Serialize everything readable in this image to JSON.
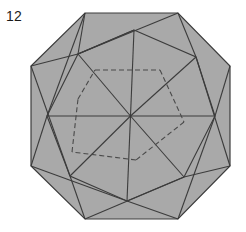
{
  "figure": {
    "label": "12",
    "title": "Octagon origami crease pattern diagram 12",
    "canvas": {
      "width": 246,
      "height": 232,
      "background": "#ffffff"
    },
    "colors": {
      "paper_fill": "#a9a9a9",
      "stroke": "#3c3c3c",
      "dashed_stroke": "#4a4a4a",
      "label_color": "#1a1a1a"
    },
    "stroke_widths": {
      "outline": 1.2,
      "crease": 1.1,
      "dashed": 1.1
    },
    "dash_pattern": "5,3",
    "center": {
      "x": 130.5,
      "y": 116.0
    },
    "outer_octagon": {
      "name": "outer-octagon",
      "points": [
        {
          "x": 85,
          "y": 13
        },
        {
          "x": 178,
          "y": 13
        },
        {
          "x": 230,
          "y": 66
        },
        {
          "x": 230,
          "y": 166
        },
        {
          "x": 178,
          "y": 219
        },
        {
          "x": 85,
          "y": 219
        },
        {
          "x": 31,
          "y": 166
        },
        {
          "x": 31,
          "y": 66
        }
      ]
    },
    "inner_heptagon": {
      "name": "inner-rotated-polygon",
      "points": [
        {
          "x": 134,
          "y": 30
        },
        {
          "x": 196,
          "y": 57
        },
        {
          "x": 215,
          "y": 116
        },
        {
          "x": 184,
          "y": 177
        },
        {
          "x": 127,
          "y": 201
        },
        {
          "x": 70,
          "y": 176
        },
        {
          "x": 47,
          "y": 116
        },
        {
          "x": 78,
          "y": 54
        }
      ]
    },
    "spokes": {
      "name": "center-spokes",
      "endpoints": [
        {
          "x": 134,
          "y": 30
        },
        {
          "x": 196,
          "y": 57
        },
        {
          "x": 215,
          "y": 116
        },
        {
          "x": 184,
          "y": 177
        },
        {
          "x": 127,
          "y": 201
        },
        {
          "x": 70,
          "y": 176
        },
        {
          "x": 47,
          "y": 116
        },
        {
          "x": 78,
          "y": 54
        }
      ]
    },
    "dashed_hexagon": {
      "name": "dashed-inner-hexagon",
      "points": [
        {
          "x": 133,
          "y": 58
        },
        {
          "x": 180,
          "y": 80
        },
        {
          "x": 187,
          "y": 131
        },
        {
          "x": 134,
          "y": 158
        },
        {
          "x": 86,
          "y": 149
        },
        {
          "x": 77,
          "y": 96
        }
      ]
    },
    "dashed_segments": [
      {
        "name": "dash-top",
        "x1": 95,
        "y1": 70,
        "x2": 160,
        "y2": 70
      },
      {
        "name": "dash-upper-right",
        "x1": 160,
        "y1": 70,
        "x2": 184,
        "y2": 122
      },
      {
        "name": "dash-lower-right",
        "x1": 184,
        "y1": 122,
        "x2": 136,
        "y2": 160
      },
      {
        "name": "dash-bottom",
        "x1": 136,
        "y1": 160,
        "x2": 72,
        "y2": 152
      },
      {
        "name": "dash-lower-left",
        "x1": 72,
        "y1": 152,
        "x2": 78,
        "y2": 99
      },
      {
        "name": "dash-upper-left",
        "x1": 78,
        "y1": 99,
        "x2": 95,
        "y2": 70
      }
    ],
    "crease_lines": [
      {
        "name": "crease-n-vertical",
        "x1": 130.5,
        "y1": 116,
        "x2": 134,
        "y2": 30
      },
      {
        "name": "crease-ne",
        "x1": 130.5,
        "y1": 116,
        "x2": 196,
        "y2": 57
      },
      {
        "name": "crease-e-horizontal",
        "x1": 130.5,
        "y1": 116,
        "x2": 215,
        "y2": 116
      },
      {
        "name": "crease-se",
        "x1": 130.5,
        "y1": 116,
        "x2": 184,
        "y2": 177
      },
      {
        "name": "crease-s",
        "x1": 130.5,
        "y1": 116,
        "x2": 127,
        "y2": 201
      },
      {
        "name": "crease-sw",
        "x1": 130.5,
        "y1": 116,
        "x2": 70,
        "y2": 176
      },
      {
        "name": "crease-w-horizontal",
        "x1": 130.5,
        "y1": 116,
        "x2": 47,
        "y2": 116
      },
      {
        "name": "crease-nw",
        "x1": 130.5,
        "y1": 116,
        "x2": 78,
        "y2": 54
      }
    ],
    "connector_lines": [
      {
        "name": "connector-top-left",
        "x1": 85,
        "y1": 13,
        "x2": 78,
        "y2": 54
      },
      {
        "name": "connector-top-right",
        "x1": 178,
        "y1": 13,
        "x2": 196,
        "y2": 57
      },
      {
        "name": "connector-right-top",
        "x1": 230,
        "y1": 66,
        "x2": 215,
        "y2": 116
      },
      {
        "name": "connector-right-bottom",
        "x1": 230,
        "y1": 166,
        "x2": 184,
        "y2": 177
      },
      {
        "name": "connector-bottom-right",
        "x1": 178,
        "y1": 219,
        "x2": 127,
        "y2": 201
      },
      {
        "name": "connector-bottom-left",
        "x1": 85,
        "y1": 219,
        "x2": 70,
        "y2": 176
      },
      {
        "name": "connector-left-bottom",
        "x1": 31,
        "y1": 166,
        "x2": 47,
        "y2": 116
      },
      {
        "name": "connector-left-top",
        "x1": 31,
        "y1": 66,
        "x2": 78,
        "y2": 54
      }
    ],
    "chord_lines": [
      {
        "name": "chord-top",
        "x1": 78,
        "y1": 54,
        "x2": 178,
        "y2": 13
      },
      {
        "name": "chord-upper-right",
        "x1": 196,
        "y1": 57,
        "x2": 230,
        "y2": 166
      },
      {
        "name": "chord-right",
        "x1": 215,
        "y1": 116,
        "x2": 178,
        "y2": 219
      },
      {
        "name": "chord-lower-right",
        "x1": 184,
        "y1": 177,
        "x2": 85,
        "y2": 219
      },
      {
        "name": "chord-bottom",
        "x1": 127,
        "y1": 201,
        "x2": 31,
        "y2": 166
      },
      {
        "name": "chord-lower-left",
        "x1": 70,
        "y1": 176,
        "x2": 31,
        "y2": 66
      },
      {
        "name": "chord-left",
        "x1": 47,
        "y1": 116,
        "x2": 85,
        "y2": 13
      },
      {
        "name": "chord-upper-left",
        "x1": 78,
        "y1": 54,
        "x2": 134,
        "y2": 30
      }
    ]
  }
}
